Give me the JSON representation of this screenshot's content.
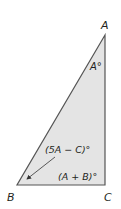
{
  "diagram": {
    "type": "right-triangle",
    "fill_color": "#e4e4e4",
    "stroke_color": "#555555",
    "vertices": {
      "A": {
        "label": "A",
        "x": 105,
        "y": 35
      },
      "B": {
        "label": "B",
        "x": 17,
        "y": 185
      },
      "C": {
        "label": "C",
        "x": 105,
        "y": 185
      }
    },
    "angle_labels": {
      "A": "A°",
      "B": "(5A − C)°",
      "C": "(A + B)°"
    }
  }
}
